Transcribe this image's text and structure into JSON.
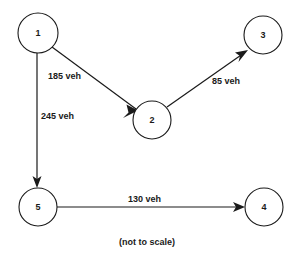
{
  "diagram": {
    "caption": "(not to scale)",
    "stroke_color": "#1a1a1a",
    "background_color": "#ffffff",
    "nodes": [
      {
        "id": "1",
        "label": "1",
        "cx": 38,
        "cy": 33,
        "r": 20
      },
      {
        "id": "2",
        "label": "2",
        "cx": 152,
        "cy": 120,
        "r": 19
      },
      {
        "id": "3",
        "label": "3",
        "cx": 263,
        "cy": 35,
        "r": 19
      },
      {
        "id": "4",
        "label": "4",
        "cx": 264,
        "cy": 207,
        "r": 19
      },
      {
        "id": "5",
        "label": "5",
        "cx": 38,
        "cy": 207,
        "r": 19
      }
    ],
    "edges": [
      {
        "id": "edge-1-2",
        "from": "1",
        "to": "2",
        "label": "185 veh",
        "value": 185,
        "unit": "veh",
        "x1": 52,
        "y1": 47,
        "x2": 136,
        "y2": 109,
        "label_x": 48,
        "label_y": 76
      },
      {
        "id": "edge-1-5",
        "from": "1",
        "to": "5",
        "label": "245 veh",
        "value": 245,
        "unit": "veh",
        "x1": 37,
        "y1": 53,
        "x2": 37,
        "y2": 186,
        "label_x": 41,
        "label_y": 116
      },
      {
        "id": "edge-2-3",
        "from": "2",
        "to": "3",
        "label": "85 veh",
        "value": 85,
        "unit": "veh",
        "x1": 167,
        "y1": 107,
        "x2": 247,
        "y2": 50,
        "label_x": 212,
        "label_y": 81
      },
      {
        "id": "edge-5-4",
        "from": "5",
        "to": "4",
        "label": "130 veh",
        "value": 130,
        "unit": "veh",
        "x1": 57,
        "y1": 207,
        "x2": 244,
        "y2": 207,
        "label_x": 128,
        "label_y": 199
      }
    ],
    "caption_x": 147,
    "caption_y": 242
  }
}
